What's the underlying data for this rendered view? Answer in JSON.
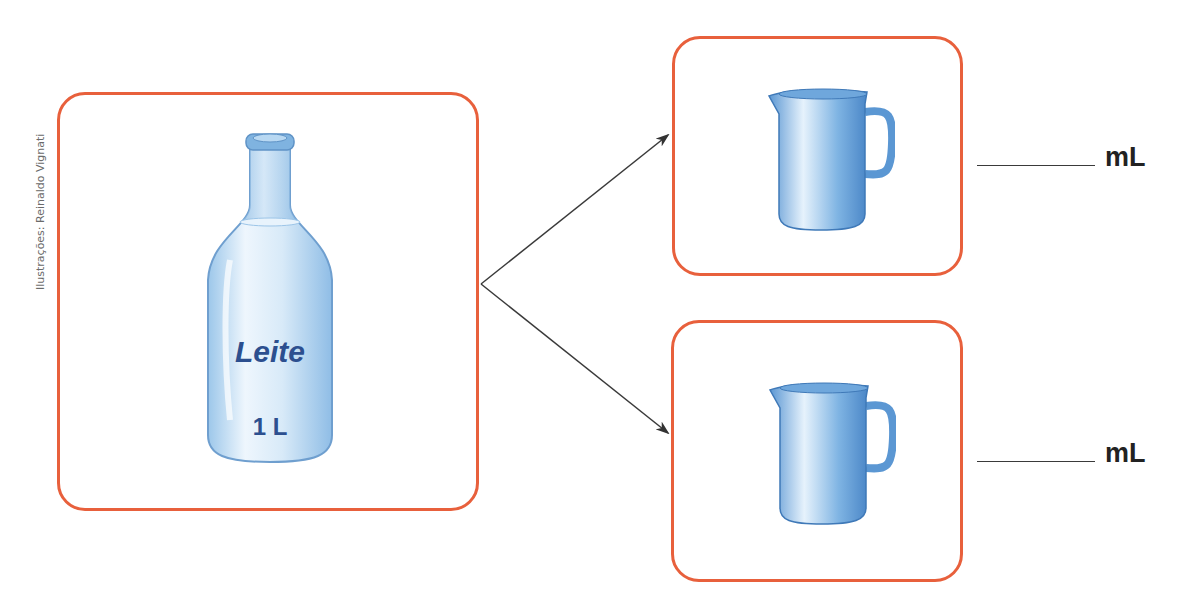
{
  "credit": "Ilustrações: Reinaldo Vignati",
  "bottle": {
    "label": "Leite",
    "volume": "1 L",
    "icon": "milk-bottle-icon"
  },
  "pitchers": [
    {
      "icon": "pitcher-icon",
      "answer_blank": "",
      "unit": "mL"
    },
    {
      "icon": "pitcher-icon",
      "answer_blank": "",
      "unit": "mL"
    }
  ],
  "colors": {
    "box_border": "#e8603c",
    "arrow": "#3a3a3a",
    "bottle_text": "#2c4f8f",
    "pitcher_blue": "#6aa6dc"
  }
}
